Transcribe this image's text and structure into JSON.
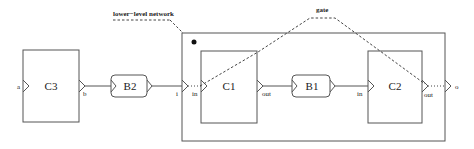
{
  "diagram": {
    "annotations": {
      "lower_level_network": "lower−level network",
      "gate": "gate"
    },
    "components": {
      "c3": "C3",
      "c1": "C1",
      "c2": "C2"
    },
    "buffers": {
      "b2": "B2",
      "b1": "B1"
    },
    "ports": {
      "a": "a",
      "b": "b",
      "i": "i",
      "c1_in": "in",
      "c1_out": "out",
      "c2_in": "in",
      "c2_out": "out",
      "o": "o"
    },
    "colors": {
      "stroke": "#555555",
      "text": "#222222",
      "background": "#ffffff"
    }
  }
}
